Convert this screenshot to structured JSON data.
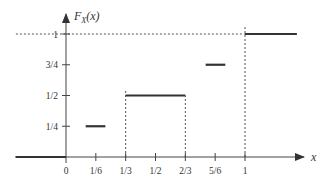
{
  "chart_data": {
    "type": "line",
    "subtype": "step-cdf",
    "title": "",
    "ylabel": "F_X(x)",
    "ylabel_main": "F",
    "ylabel_sub": "X",
    "ylabel_arg": "(x)",
    "xlabel": "x",
    "xlim": [
      -0.3,
      1.35
    ],
    "ylim": [
      0,
      1.1
    ],
    "grid": false,
    "legend": null,
    "x_ticks": [
      {
        "value": 0,
        "label": "0"
      },
      {
        "value": 0.1667,
        "label": "1/6"
      },
      {
        "value": 0.3333,
        "label": "1/3"
      },
      {
        "value": 0.5,
        "label": "1/2"
      },
      {
        "value": 0.6667,
        "label": "2/3"
      },
      {
        "value": 0.8333,
        "label": "5/6"
      },
      {
        "value": 1,
        "label": "1"
      }
    ],
    "y_ticks": [
      {
        "value": 0.25,
        "label": "1/4"
      },
      {
        "value": 0.5,
        "label": "1/2"
      },
      {
        "value": 0.75,
        "label": "3/4"
      },
      {
        "value": 1,
        "label": "1"
      }
    ],
    "segments": [
      {
        "x_start": -0.28,
        "x_end": 0,
        "y": 0
      },
      {
        "x_start": 0.11,
        "x_end": 0.22,
        "y": 0.25
      },
      {
        "x_start": 0.3333,
        "x_end": 0.6667,
        "y": 0.5
      },
      {
        "x_start": 0.78,
        "x_end": 0.89,
        "y": 0.75
      },
      {
        "x_start": 1,
        "x_end": 1.29,
        "y": 1
      }
    ],
    "dashed_verticals": [
      {
        "x": 0.3333,
        "y_from": 0,
        "y_to": 0.55
      },
      {
        "x": 0.6667,
        "y_from": 0,
        "y_to": 0.5
      },
      {
        "x": 1,
        "y_from": 0,
        "y_to": 1.07
      }
    ],
    "dashed_horizontals": [
      {
        "y": 1,
        "x_from": -0.28,
        "x_to": 1
      }
    ]
  }
}
